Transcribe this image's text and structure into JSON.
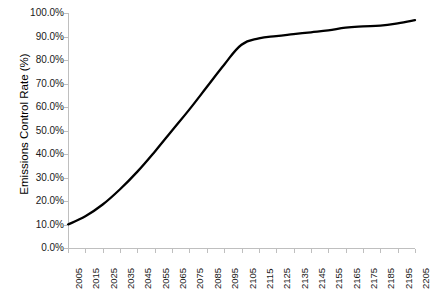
{
  "chart_data": {
    "type": "line",
    "title": "",
    "xlabel": "",
    "ylabel": "Emissions Control Rate (%)",
    "grid": false,
    "legend": "none",
    "xlim": [
      2005,
      2205
    ],
    "ylim": [
      0,
      100
    ],
    "ytick_labels": [
      "100.0%",
      "90.0%",
      "80.0%",
      "70.0%",
      "60.0%",
      "50.0%",
      "40.0%",
      "30.0%",
      "20.0%",
      "10.0%",
      "0.0%"
    ],
    "ytick_values": [
      100,
      90,
      80,
      70,
      60,
      50,
      40,
      30,
      20,
      10,
      0
    ],
    "xtick_labels": [
      "2005",
      "2015",
      "2025",
      "2035",
      "2045",
      "2055",
      "2065",
      "2075",
      "2085",
      "2095",
      "2105",
      "2115",
      "2125",
      "2135",
      "2145",
      "2155",
      "2165",
      "2175",
      "2185",
      "2195",
      "2205"
    ],
    "x": [
      2005,
      2015,
      2025,
      2035,
      2045,
      2055,
      2065,
      2075,
      2085,
      2095,
      2105,
      2115,
      2125,
      2135,
      2145,
      2155,
      2165,
      2175,
      2185,
      2195,
      2205
    ],
    "series": [
      {
        "name": "Emissions Control Rate",
        "color": "#000000",
        "values": [
          10.0,
          13.5,
          18.5,
          25.0,
          32.5,
          41.0,
          50.0,
          59.0,
          68.5,
          78.0,
          86.5,
          89.2,
          90.2,
          91.0,
          91.8,
          92.6,
          93.8,
          94.3,
          94.6,
          95.6,
          97.0
        ]
      }
    ]
  }
}
